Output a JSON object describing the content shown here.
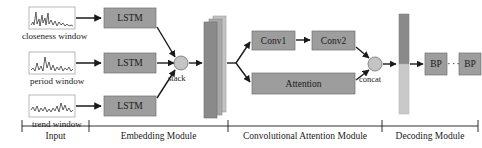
{
  "figure": {
    "type": "neural-network-architecture-diagram",
    "background_color": "#ffffff"
  },
  "colors": {
    "box_fill": "#9d9d9d",
    "box_stroke": "#6f6f6f",
    "tensor_front": "#8a8a8a",
    "tensor_mid": "#a8a8a8",
    "tensor_back": "#c2c2c2",
    "bar_top": "#8a8a8a",
    "bar_bottom": "#c9c9c9",
    "circle_fill": "#c4c4c4",
    "circle_stroke": "#6f6f6f",
    "plot_stroke": "#9a9a9a",
    "line": "#1a1a1a",
    "text": "#1a1a1a"
  },
  "input_module": {
    "windows": [
      {
        "caption": "closeness window",
        "icon": "timeseries-plot-icon"
      },
      {
        "caption": "period window",
        "icon": "timeseries-plot-icon"
      },
      {
        "caption": "trend window",
        "icon": "timeseries-plot-icon"
      }
    ]
  },
  "embedding_module": {
    "encoders": [
      {
        "label": "LSTM"
      },
      {
        "label": "LSTM"
      },
      {
        "label": "LSTM"
      }
    ],
    "merge_op": {
      "label": "stack",
      "icon": "merge-node-icon"
    },
    "tensor": {
      "name": "stacked-feature-tensor",
      "layers": 3
    }
  },
  "convolutional_attention_module": {
    "conv_blocks": [
      {
        "label": "Conv1"
      },
      {
        "label": "Conv2"
      }
    ],
    "attention_block": {
      "label": "Attention"
    },
    "merge_op": {
      "label": "concat",
      "icon": "merge-node-icon"
    },
    "output_tensor": {
      "name": "concat-feature-bar"
    }
  },
  "decoding_module": {
    "predictors": [
      {
        "label": "BP"
      },
      {
        "label": "BP"
      }
    ],
    "ellipsis": "···"
  },
  "axis": {
    "sections": [
      {
        "label": "Input"
      },
      {
        "label": "Embedding Module"
      },
      {
        "label": "Convolutional Attention Module"
      },
      {
        "label": "Decoding Module"
      }
    ]
  }
}
